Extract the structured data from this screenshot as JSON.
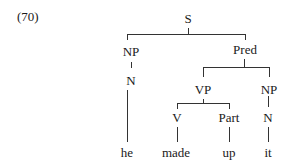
{
  "example_number": "(70)",
  "tree": {
    "root": "S",
    "nodes": {
      "S": "S",
      "NP_subject": "NP",
      "N_subject": "N",
      "Pred": "Pred",
      "VP": "VP",
      "NP_object": "NP",
      "V": "V",
      "Part": "Part",
      "N_object": "N"
    },
    "words": {
      "he": "he",
      "made": "made",
      "up": "up",
      "it": "it"
    },
    "structure": "[S [NP [N he]] [Pred [VP [V made] [Part up]] [NP [N it]]]]"
  },
  "colors": {
    "line": "#333333",
    "text": "#1a1a1a",
    "background": "#ffffff"
  }
}
